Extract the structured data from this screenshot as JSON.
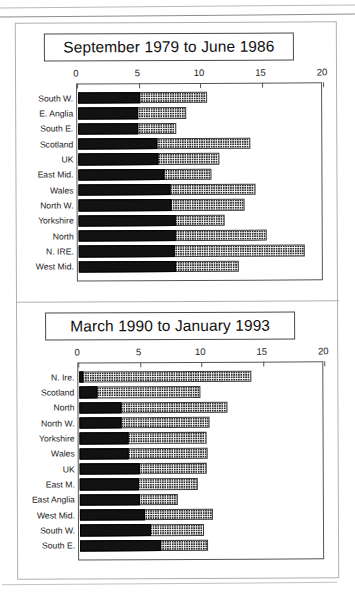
{
  "document": {
    "kind": "scanned-figure-page",
    "panel_count": 2
  },
  "axis": {
    "ticks": [
      "0",
      "5",
      "10",
      "15",
      "20"
    ],
    "tick_values": [
      0,
      5,
      10,
      15,
      20
    ],
    "min": 0,
    "max": 20
  },
  "panels": [
    {
      "id": "panel-1979-1986",
      "title": "September 1979 to June 1986"
    },
    {
      "id": "panel-1990-1993",
      "title": "March 1990 to January 1993"
    }
  ],
  "colors": {
    "dark_segment": "#121212",
    "dotted_segment": "#f2f2f2",
    "outline": "#3b3b3b",
    "frame": "#b0b0b0"
  },
  "chart_data": [
    {
      "type": "bar",
      "orientation": "horizontal",
      "stacked": true,
      "title": "September 1979 to June 1986",
      "xlabel": "",
      "ylabel": "",
      "xlim": [
        0,
        20
      ],
      "xticks": [
        0,
        5,
        10,
        15,
        20
      ],
      "grid": false,
      "legend": "none",
      "categories": [
        "South W.",
        "E. Anglia",
        "South E.",
        "Scotland",
        "UK",
        "East Mid.",
        "Wales",
        "North W.",
        "Yorkshire",
        "North",
        "N. IRE.",
        "West Mid."
      ],
      "series": [
        {
          "name": "dark",
          "values": [
            5.0,
            4.9,
            4.9,
            6.4,
            6.5,
            7.0,
            7.5,
            7.6,
            7.9,
            7.9,
            7.8,
            7.9
          ]
        },
        {
          "name": "dotted",
          "values": [
            5.5,
            3.9,
            3.1,
            7.6,
            5.0,
            3.8,
            6.9,
            5.9,
            4.0,
            7.4,
            10.6,
            5.1
          ]
        }
      ],
      "totals": [
        10.5,
        8.8,
        8.0,
        14.0,
        11.5,
        10.8,
        14.4,
        13.5,
        11.9,
        15.3,
        18.4,
        13.0
      ]
    },
    {
      "type": "bar",
      "orientation": "horizontal",
      "stacked": true,
      "title": "March 1990 to January 1993",
      "xlabel": "",
      "ylabel": "",
      "xlim": [
        0,
        20
      ],
      "xticks": [
        0,
        5,
        10,
        15,
        20
      ],
      "grid": false,
      "legend": "none",
      "categories": [
        "N. Ire.",
        "Scotland",
        "North",
        "North W.",
        "Yorkshire",
        "Wales",
        "UK",
        "East M.",
        "East Anglia",
        "West Mid.",
        "South W.",
        "South E."
      ],
      "series": [
        {
          "name": "dark",
          "values": [
            0.3,
            1.5,
            3.4,
            3.4,
            4.0,
            4.0,
            4.9,
            4.8,
            4.9,
            5.3,
            5.8,
            6.6
          ]
        },
        {
          "name": "dotted",
          "values": [
            13.7,
            8.3,
            8.6,
            7.2,
            6.3,
            6.4,
            5.4,
            4.8,
            3.1,
            5.5,
            4.3,
            3.8
          ]
        }
      ],
      "totals": [
        14.0,
        9.8,
        12.0,
        10.6,
        10.3,
        10.4,
        10.3,
        9.6,
        8.0,
        10.8,
        10.1,
        10.4
      ]
    }
  ]
}
